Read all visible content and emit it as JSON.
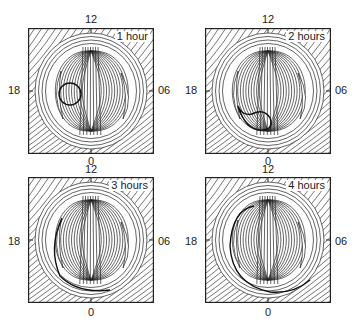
{
  "figure": {
    "panels": [
      {
        "title": "1 hour",
        "top": "12",
        "left": "18",
        "right": "06",
        "bottom": "0",
        "feature": "circle"
      },
      {
        "title": "2 hours",
        "top": "12",
        "left": "18",
        "right": "06",
        "bottom": "0",
        "feature": "blob"
      },
      {
        "title": "3 hours",
        "top": "12",
        "left": "18",
        "right": "06",
        "bottom": "0",
        "feature": "arc"
      },
      {
        "title": "4 hours",
        "top": "12",
        "left": "18",
        "right": "06",
        "bottom": "0",
        "feature": "longarc"
      }
    ]
  }
}
